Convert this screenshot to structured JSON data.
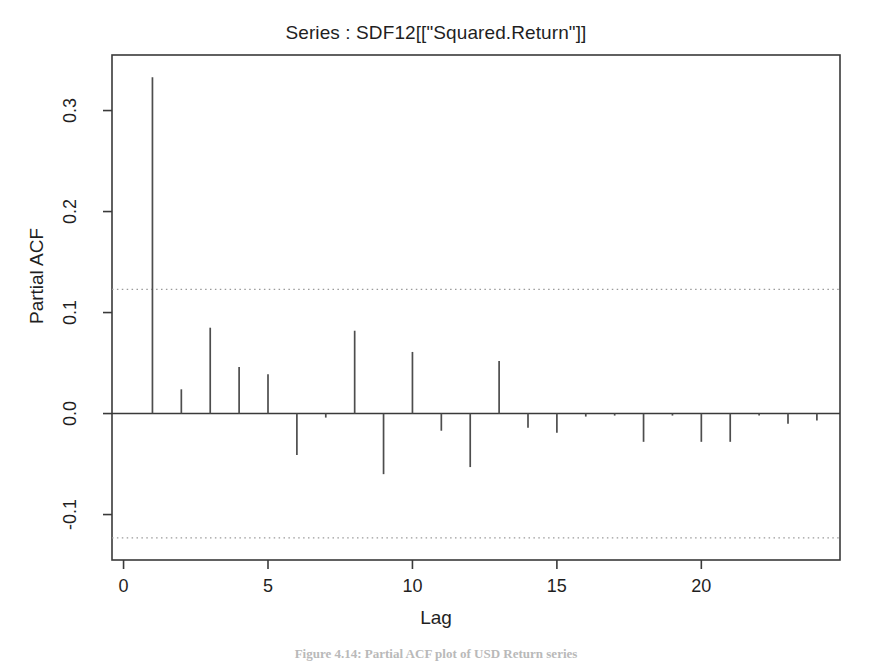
{
  "chart_data": {
    "type": "bar",
    "title": "Series : SDF12[[\"Squared.Return\"]]",
    "xlabel": "Lag",
    "ylabel": "Partial ACF",
    "x": [
      1,
      2,
      3,
      4,
      5,
      6,
      7,
      8,
      9,
      10,
      11,
      12,
      13,
      14,
      15,
      16,
      17,
      18,
      19,
      20,
      21,
      22,
      23,
      24
    ],
    "values": [
      0.333,
      0.024,
      0.085,
      0.046,
      0.039,
      -0.041,
      -0.004,
      0.082,
      -0.06,
      0.061,
      -0.017,
      -0.053,
      0.052,
      -0.014,
      -0.019,
      -0.003,
      -0.002,
      -0.028,
      -0.002,
      -0.028,
      -0.028,
      -0.002,
      -0.01,
      -0.007
    ],
    "xlim": [
      -0.4,
      24.8
    ],
    "ylim": [
      -0.145,
      0.355
    ],
    "xticks": [
      0,
      5,
      10,
      15,
      20
    ],
    "xtick_labels": [
      "0",
      "5",
      "10",
      "15",
      "20"
    ],
    "yticks": [
      -0.1,
      0.0,
      0.1,
      0.2,
      0.3
    ],
    "ytick_labels": [
      "-0.1",
      "0.0",
      "0.1",
      "0.2",
      "0.3"
    ],
    "grid": false,
    "legend": "none",
    "zero_line": 0.0,
    "confidence_bands": [
      0.123,
      -0.123
    ],
    "confidence_band_style": "dotted",
    "colors": {
      "spike": "#4d4d4d",
      "axis": "#3a3a3a",
      "confidence": "#9a9a9a",
      "background": "#ffffff"
    }
  },
  "caption": {
    "text": "Figure 4.14: Partial ACF plot of USD Return series"
  }
}
